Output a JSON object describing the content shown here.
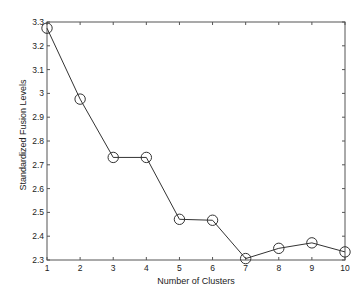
{
  "chart_data": {
    "type": "line",
    "title": "",
    "xlabel": "Number of Clusters",
    "ylabel": "Standardized Fusion Levels",
    "x": [
      1,
      2,
      3,
      4,
      5,
      6,
      7,
      8,
      9,
      10
    ],
    "series": [
      {
        "name": "Standardized Fusion Levels",
        "values": [
          3.274,
          2.976,
          2.731,
          2.731,
          2.471,
          2.467,
          2.306,
          2.349,
          2.372,
          2.334
        ],
        "marker": "circle",
        "color": "#333333"
      }
    ],
    "xlim": [
      1,
      10
    ],
    "ylim": [
      2.3,
      3.3
    ],
    "xticks": [
      "1",
      "2",
      "3",
      "4",
      "5",
      "6",
      "7",
      "8",
      "9",
      "10"
    ],
    "yticks": [
      "2.3",
      "2.4",
      "2.5",
      "2.6",
      "2.7",
      "2.8",
      "2.9",
      "3",
      "3.1",
      "3.2",
      "3.3"
    ],
    "grid": false,
    "legend": null
  },
  "style": {
    "axis_color": "#555555",
    "line_color": "#333333",
    "text_color": "#222222"
  }
}
